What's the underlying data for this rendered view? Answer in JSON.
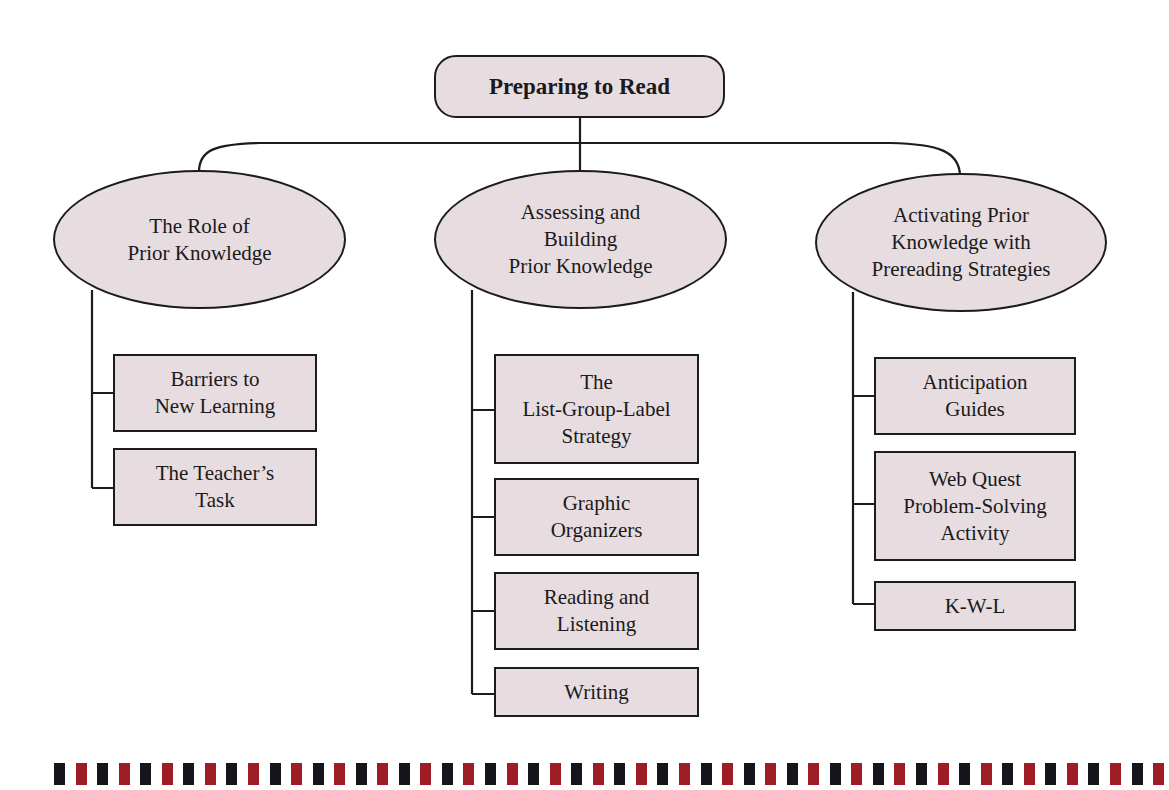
{
  "diagram": {
    "title": "Preparing to Read",
    "colors": {
      "node_fill": "#e7dce0",
      "stroke": "#1c1c1c",
      "bar_dark": "#15151c",
      "bar_red": "#9e1c26"
    },
    "branches": [
      {
        "label": "The Role of\nPrior Knowledge",
        "children": [
          "Barriers to\nNew Learning",
          "The Teacher’s\nTask"
        ]
      },
      {
        "label": "Assessing and\nBuilding\nPrior Knowledge",
        "children": [
          "The\nList-Group-Label\nStrategy",
          "Graphic\nOrganizers",
          "Reading and\nListening",
          "Writing"
        ]
      },
      {
        "label": "Activating Prior\nKnowledge with\nPrereading Strategies",
        "children": [
          "Anticipation\nGuides",
          "Web Quest\nProblem-Solving\nActivity",
          "K-W-L"
        ]
      }
    ]
  },
  "decorative_bar": {
    "pattern": [
      "dark",
      "red"
    ],
    "count": 52
  }
}
